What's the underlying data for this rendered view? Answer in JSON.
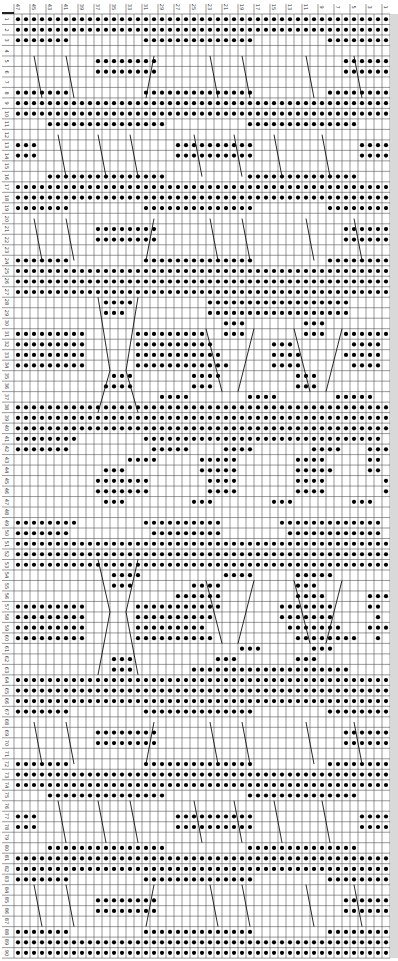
{
  "chart": {
    "title": "",
    "columns": 47,
    "rows": 90,
    "column_labels": [
      "47",
      "45",
      "43",
      "41",
      "39",
      "37",
      "35",
      "33",
      "31",
      "29",
      "27",
      "25",
      "23",
      "21",
      "19",
      "17",
      "15",
      "13",
      "11",
      "9",
      "7",
      "5",
      "3",
      "1"
    ],
    "column_label_positions": [
      47,
      45,
      43,
      41,
      39,
      37,
      35,
      33,
      31,
      29,
      27,
      25,
      23,
      21,
      19,
      17,
      15,
      13,
      11,
      9,
      7,
      5,
      3,
      1
    ],
    "row_labels_start": 1,
    "row_labels_end": 90,
    "grid": {
      "x0": 14,
      "y0": 14,
      "cell_w": 8,
      "cell_h": 10.49
    },
    "colors": {
      "grid": "#555555",
      "dot": "#000000",
      "bg": "#ffffff",
      "label": "#333333",
      "border": "#9a9a9a"
    },
    "legend": {
      "o": "purl (dot)",
      ".": "knit (blank)",
      "/": "cable crossing line"
    },
    "rows_data": [
      "ooooooooooooooooooooooooooooooooooooooooooooooo",
      "ooooooooooooooooooooooooooooooooooooooooooooooo",
      "ooooooo.........oooooooooooooo.........oooooooo",
      "...............................................",
      "..........oooooooo.......................oooooo",
      "..........oooooooo.......................oooooo",
      "...............................................",
      "ooooooo.........oooooooooooooo.........oooooooo",
      "ooooooooooooooooooooooooooooooooooooooooooooooo",
      "ooooooooooooooooooooooooooooooooooooooooooooooo",
      "....ooooooooooooooo..........oooooooooooooo....",
      "...............................................",
      "ooo.................oooooooooo.............oooo",
      "ooo.................oooooooooo.............oooo",
      "...............................................",
      "....ooooooooooooooo..........oooooooooooooo....",
      "ooooooooooooooooooooooooooooooooooooooooooooooo",
      "ooooooooooooooooooooooooooooooooooooooooooooooo",
      "ooooooo.........oooooooooooooo.........oooooooo",
      "...............................................",
      "..........oooooooo.......................oooooo",
      "..........oooooooo.......................oooooo",
      "...............................................",
      "ooooooo.........oooooooooooooo.........oooooooo",
      "ooooooooooooooooooooooooooooooooooooooooooooooo",
      "ooooooooooooooooooooooooooooooooooooooooooooooo",
      "ooooooooooooooooooooooooooooooooooooooooooooooo",
      "...........oooo.........oooooooooooooooooo.....",
      "...........ooo..........oooooooooooooooooo.....",
      "..........................ooo.......ooo........",
      "ooooooooo......ooooooooo..ooo.......ooo..oooooo",
      "ooooooooo......oooooooooo.......ooo.......oooo.",
      "ooooooooo......ooooooooooo......oooo.....ooooo.",
      "ooooooooo......oooooooooooo.....oooo......oooo.",
      "............ooo.......oooo.........ooo.........",
      "...........oooo.......ooo..........ooo.........",
      "..................oooo.......oooo.......ooooo..",
      "ooooooooooooooooooooooooooooooooooooooooooooooo",
      "ooooooooooooooooooooooooooooooooooooooooooooooo",
      "ooooooooooooooooooooooooooooooooooooooooooooooo",
      "oooooooo........oooooooooooooooooooooooooooooo.",
      "ooooooo..........ooooo....oooo.......oooo...ooo",
      "..............oooo.....ooooo.......oooo.....oo.",
      "...........ooo.........ooooo.......ooooo....oo.",
      "..........ooooooo.......oooo.......oooo.......o",
      "..........ooooooo.......oooo.......oooo.......o",
      "...........ooo........ooo.......ooo.......ooo..",
      "...............................................",
      "oooooooo........oooooooooo.......ooooooooooooo.",
      "ooooooo..........ooooooooo........oooooooooooo.",
      "ooooooooooooooooooooooooooooooooooooooooooooooo",
      "ooooooooooooooooooooooooooooooooooooooooooooooo",
      "ooooooooooooooooooooooooooooooooooooooooooooooo",
      "............oooo..........oooo.....ooooo.......",
      "............ooo.......oooo.........ooo.........",
      "....................oooooo.........oooo.....ooo",
      "ooooooooo......ooooooooooo.......ooooooo....oo.",
      "ooooooooo......oooooooooo........ooooooo.....o.",
      "ooooooooo......ooooooooo..........ooooooo...ooo",
      "ooooooooo......oooooooooo..........oooooooo..o.",
      "............................ooo......ooo.......",
      "............ooo..........ooo.......ooo.........",
      "............ooo.......oooooooooooooooooooo.....",
      "ooooooooooooooooooooooooooooooooooooooooooooooo",
      "ooooooooooooooooooooooooooooooooooooooooooooooo",
      "ooooooooooooooooooooooooooooooooooooooooooooooo",
      "ooooooo.........oooooooooooooo.........oooooooo",
      "...............................................",
      "..........oooooooo.......................oooooo",
      "..........oooooooo.......................oooooo",
      "...............................................",
      "ooooooo.........oooooooooooooo.........oooooooo",
      "ooooooooooooooooooooooooooooooooooooooooooooooo",
      "ooooooooooooooooooooooooooooooooooooooooooooooo",
      "....ooooooooooooooo..........oooooooooooooo....",
      "...............................................",
      "ooo.................oooooooooo.............oooo",
      "ooo.................oooooooooo.............oooo",
      "...............................................",
      "....ooooooooooooooo..........oooooooooooooo....",
      "ooooooooooooooooooooooooooooooooooooooooooooooo",
      "ooooooooooooooooooooooooooooooooooooooooooooooo",
      "ooooooo.........oooooooooooooo.........oooooooo",
      "...............................................",
      "..........oooooooo.......................oooooo",
      "..........oooooooo.......................oooooo",
      "...............................................",
      "ooooooo.........oooooooooooooo.........oooooooo",
      "ooooooooooooooooooooooooooooooooooooooooooooooo",
      "ooooooooooooooooooooooooooooooooooooooooooooooo"
    ],
    "cable_lines": [
      [
        2.5,
        4,
        3.5,
        8
      ],
      [
        6.5,
        4,
        7.5,
        8
      ],
      [
        17.5,
        4,
        16.5,
        8
      ],
      [
        24.5,
        4,
        25.5,
        8
      ],
      [
        28.5,
        4,
        29.5,
        8
      ],
      [
        36.5,
        4,
        37.5,
        8
      ],
      [
        42.5,
        4,
        43.5,
        8
      ],
      [
        5.5,
        11.5,
        6.5,
        15.5
      ],
      [
        10.5,
        11.5,
        11.5,
        15.5
      ],
      [
        14.5,
        11.5,
        15.5,
        15.5
      ],
      [
        22.5,
        11.5,
        23.5,
        15.5
      ],
      [
        27.5,
        11.5,
        28.5,
        15.5
      ],
      [
        32.5,
        11.5,
        33.5,
        15.5
      ],
      [
        38.5,
        11.5,
        39.5,
        15.5
      ],
      [
        2.5,
        19.5,
        3.5,
        23.5
      ],
      [
        6.5,
        19.5,
        7.5,
        23.5
      ],
      [
        17.5,
        19.5,
        16.5,
        23.5
      ],
      [
        24.5,
        19.5,
        25.5,
        23.5
      ],
      [
        28.5,
        19.5,
        29.5,
        23.5
      ],
      [
        36.5,
        19.5,
        37.5,
        23.5
      ],
      [
        42.5,
        19.5,
        43.5,
        23.5
      ],
      [
        10.5,
        27,
        12,
        34
      ],
      [
        15.5,
        27,
        14,
        34
      ],
      [
        12,
        34,
        10.5,
        38
      ],
      [
        14,
        34,
        15.5,
        38
      ],
      [
        24,
        30,
        26,
        36
      ],
      [
        30,
        30,
        28,
        36
      ],
      [
        35,
        30,
        37,
        36
      ],
      [
        41,
        30,
        39,
        36
      ],
      [
        10.5,
        52,
        12,
        57
      ],
      [
        15.5,
        52,
        14,
        57
      ],
      [
        12,
        57,
        10.5,
        63
      ],
      [
        14,
        57,
        15.5,
        63
      ],
      [
        24,
        54,
        26,
        60
      ],
      [
        30,
        54,
        28,
        60
      ],
      [
        35,
        54,
        37,
        60
      ],
      [
        41,
        54,
        39,
        60
      ],
      [
        2.5,
        67.5,
        3.5,
        71.5
      ],
      [
        6.5,
        67.5,
        7.5,
        71.5
      ],
      [
        17.5,
        67.5,
        16.5,
        71.5
      ],
      [
        24.5,
        67.5,
        25.5,
        71.5
      ],
      [
        28.5,
        67.5,
        29.5,
        71.5
      ],
      [
        36.5,
        67.5,
        37.5,
        71.5
      ],
      [
        42.5,
        67.5,
        43.5,
        71.5
      ],
      [
        5.5,
        75,
        6.5,
        79
      ],
      [
        10.5,
        75,
        11.5,
        79
      ],
      [
        14.5,
        75,
        15.5,
        79
      ],
      [
        22.5,
        75,
        23.5,
        79
      ],
      [
        27.5,
        75,
        28.5,
        79
      ],
      [
        32.5,
        75,
        33.5,
        79
      ],
      [
        38.5,
        75,
        39.5,
        79
      ],
      [
        2.5,
        83,
        3.5,
        87
      ],
      [
        6.5,
        83,
        7.5,
        87
      ],
      [
        17.5,
        83,
        16.5,
        87
      ],
      [
        24.5,
        83,
        25.5,
        87
      ],
      [
        28.5,
        83,
        29.5,
        87
      ],
      [
        36.5,
        83,
        37.5,
        87
      ],
      [
        42.5,
        83,
        43.5,
        87
      ]
    ]
  }
}
